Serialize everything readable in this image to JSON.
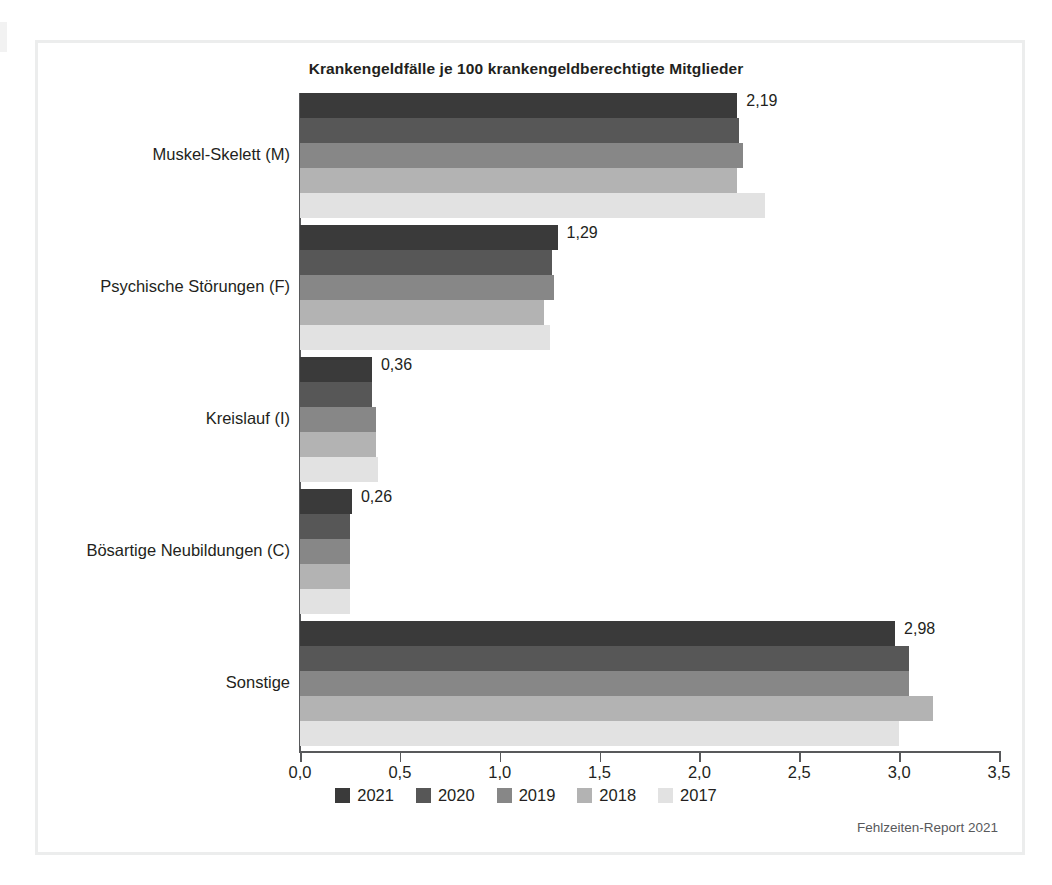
{
  "chart_data": {
    "type": "bar",
    "orientation": "horizontal",
    "title": "Krankengeldfälle je 100 krankengeldberechtigte Mitglieder",
    "xlabel": "",
    "ylabel": "",
    "xlim": [
      0,
      3.5
    ],
    "xticks": [
      "0,0",
      "0,5",
      "1,0",
      "1,5",
      "2,0",
      "2,5",
      "3,0",
      "3,5"
    ],
    "xtick_values": [
      0,
      0.5,
      1.0,
      1.5,
      2.0,
      2.5,
      3.0,
      3.5
    ],
    "grid": false,
    "legend_position": "bottom",
    "categories": [
      "Muskel-Skelett (M)",
      "Psychische Störungen (F)",
      "Kreislauf (I)",
      "Bösartige Neubildungen (C)",
      "Sonstige"
    ],
    "series": [
      {
        "name": "2021",
        "color": "#3a3a3a",
        "values": [
          2.19,
          1.29,
          0.36,
          0.26,
          2.98
        ],
        "labels": [
          "2,19",
          "1,29",
          "0,36",
          "0,26",
          "2,98"
        ]
      },
      {
        "name": "2020",
        "color": "#575757",
        "values": [
          2.2,
          1.26,
          0.36,
          0.25,
          3.05
        ]
      },
      {
        "name": "2019",
        "color": "#878787",
        "values": [
          2.22,
          1.27,
          0.38,
          0.25,
          3.05
        ]
      },
      {
        "name": "2018",
        "color": "#b3b3b3",
        "values": [
          2.19,
          1.22,
          0.38,
          0.25,
          3.17
        ]
      },
      {
        "name": "2017",
        "color": "#e2e2e2",
        "values": [
          2.33,
          1.25,
          0.39,
          0.25,
          3.0
        ]
      }
    ],
    "value_labels_shown_for_series": "2021"
  },
  "footer": {
    "source": "Fehlzeiten-Report 2021"
  }
}
